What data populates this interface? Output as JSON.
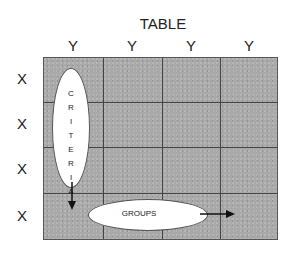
{
  "title": "TABLE",
  "columns": [
    "Y",
    "Y",
    "Y",
    "Y"
  ],
  "rows": [
    "X",
    "X",
    "X",
    "X"
  ],
  "ovals": {
    "criteria": "CRITERIA",
    "groups": "GROUPS"
  },
  "colors": {
    "cell_fill": "#a9a9a9",
    "grid_line": "#444444",
    "oval_fill": "#ffffff"
  }
}
